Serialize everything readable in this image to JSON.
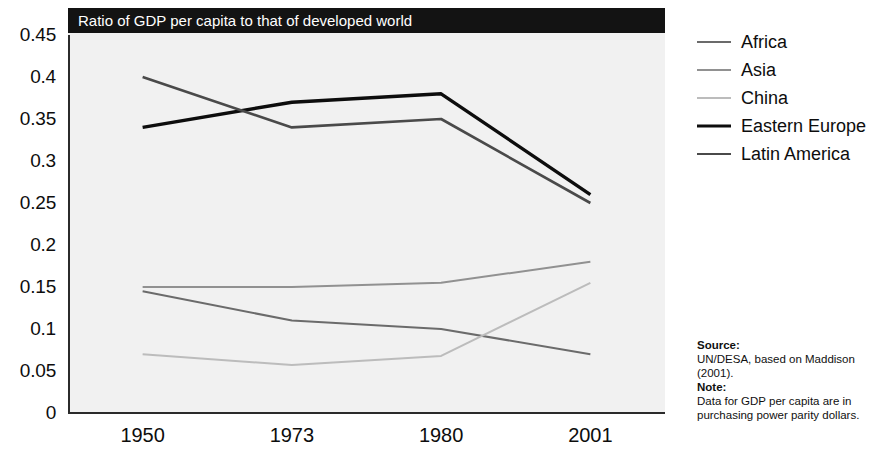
{
  "chart_data": {
    "type": "line",
    "title": "Ratio of GDP per capita to that of developed world",
    "xlabel": "",
    "ylabel": "",
    "categories": [
      "1950",
      "1973",
      "1980",
      "2001"
    ],
    "ylim": [
      0,
      0.45
    ],
    "yticks": [
      "0",
      "0.05",
      "0.1",
      "0.15",
      "0.2",
      "0.25",
      "0.3",
      "0.35",
      "0.4",
      "0.45"
    ],
    "ytick_values": [
      0,
      0.05,
      0.1,
      0.15,
      0.2,
      0.25,
      0.3,
      0.35,
      0.4,
      0.45
    ],
    "grid": false,
    "legend_position": "right",
    "series": [
      {
        "name": "Africa",
        "values": [
          0.145,
          0.11,
          0.1,
          0.07
        ],
        "color": "#6b6b6b",
        "width": 2.0
      },
      {
        "name": "Asia",
        "values": [
          0.15,
          0.15,
          0.155,
          0.18
        ],
        "color": "#919191",
        "width": 2.0
      },
      {
        "name": "China",
        "values": [
          0.07,
          0.057,
          0.068,
          0.155
        ],
        "color": "#bcbcbc",
        "width": 2.0
      },
      {
        "name": "Eastern Europe",
        "values": [
          0.34,
          0.37,
          0.38,
          0.26
        ],
        "color": "#0d0d0d",
        "width": 3.4
      },
      {
        "name": "Latin America",
        "values": [
          0.4,
          0.34,
          0.35,
          0.25
        ],
        "color": "#4a4a4a",
        "width": 2.6
      }
    ]
  },
  "legend": {
    "items": [
      {
        "label": "Africa"
      },
      {
        "label": "Asia"
      },
      {
        "label": "China"
      },
      {
        "label": "Eastern Europe"
      },
      {
        "label": "Latin America"
      }
    ]
  },
  "source_note": {
    "source_heading": "Source:",
    "source_text": "UN/DESA, based on Maddison (2001).",
    "note_heading": "Note:",
    "note_text": "Data for GDP per capita are in purchasing power parity dollars."
  },
  "colors": {
    "title_bar_bg": "#131313",
    "title_bar_text": "#ffffff",
    "plot_bg": "#f1f1f1",
    "axis": "#2b2b2b"
  }
}
